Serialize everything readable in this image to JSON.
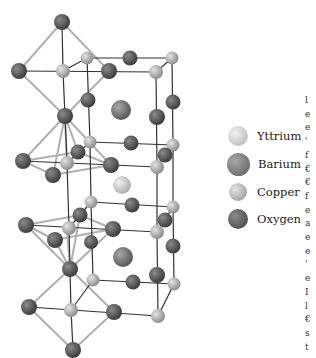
{
  "figure": {
    "colors": {
      "yttrium": "#d6d6d6",
      "barium": "#7e7e7e",
      "copper": "#b4b4b4",
      "oxygen": "#555555",
      "bond_dark": "#333333",
      "bond_light": "#b0b0b0"
    }
  },
  "legend": {
    "items": [
      {
        "label": "Yttrium",
        "element": "yttrium"
      },
      {
        "label": "Barium",
        "element": "barium"
      },
      {
        "label": "Copper",
        "element": "copper"
      },
      {
        "label": "Oxygen",
        "element": "oxygen"
      }
    ]
  },
  "edge_text": {
    "fragments": [
      "l",
      "e",
      "e",
      "'",
      "f",
      "€",
      "€",
      "f",
      "e",
      "a",
      "e",
      "e",
      "'",
      "e",
      "I",
      "l",
      "€",
      "s",
      "t"
    ]
  }
}
